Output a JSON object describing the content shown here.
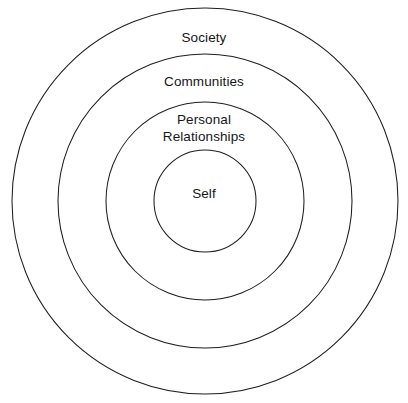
{
  "diagram": {
    "type": "concentric-circles",
    "title": "",
    "background_color": "#ffffff",
    "stroke_color": "#1f1f1f",
    "text_color": "#161616",
    "center": {
      "x": 205,
      "y": 201
    },
    "rings": [
      {
        "id": "society",
        "label": "Society",
        "level": 4,
        "radius": 193,
        "icon": "circle-outline-icon"
      },
      {
        "id": "communities",
        "label": "Communities",
        "level": 3,
        "radius": 147,
        "icon": "circle-outline-icon"
      },
      {
        "id": "personal-relationships",
        "label": "Personal\nRelationships",
        "level": 2,
        "radius": 99,
        "icon": "circle-outline-icon"
      },
      {
        "id": "self",
        "label": "Self",
        "level": 1,
        "radius": 51,
        "icon": "circle-outline-icon"
      }
    ]
  },
  "chart_data": {
    "type": "pie",
    "title": "",
    "subtitle": "",
    "xlabel": "",
    "ylabel": "",
    "categories": [
      "Self",
      "Personal Relationships",
      "Communities",
      "Society"
    ],
    "values": [
      51,
      99,
      147,
      193
    ],
    "value_units": "radius-px",
    "legend": [],
    "legend_position": "none",
    "grid": false,
    "annotations": [
      {
        "text": "Society",
        "x": 205,
        "y": 37
      },
      {
        "text": "Communities",
        "x": 205,
        "y": 81
      },
      {
        "text": "Personal",
        "x": 205,
        "y": 120
      },
      {
        "text": "Relationships",
        "x": 205,
        "y": 138
      },
      {
        "text": "Self",
        "x": 205,
        "y": 193
      }
    ]
  }
}
